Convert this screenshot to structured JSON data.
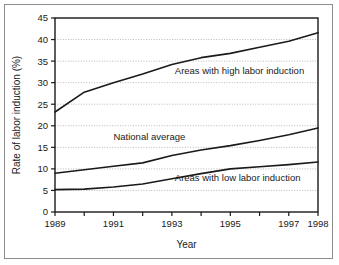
{
  "chart_data": {
    "type": "line",
    "title": "",
    "xlabel": "Year",
    "ylabel": "Rate of labor induction (%)",
    "xlim": [
      1989,
      1998
    ],
    "ylim": [
      0,
      45
    ],
    "ytick_step": 5,
    "grid": "horizontal-dotted",
    "legend_position": "inline-annotations",
    "x": [
      1989,
      1990,
      1991,
      1992,
      1993,
      1994,
      1995,
      1996,
      1997,
      1998
    ],
    "xticks": [
      1989,
      1990,
      1991,
      1992,
      1993,
      1994,
      1995,
      1996,
      1997,
      1998
    ],
    "xtick_labels": [
      "1989",
      "1991",
      "1993",
      "1995",
      "1997",
      "1998"
    ],
    "xtick_labels_values": [
      1989,
      1991,
      1993,
      1995,
      1997,
      1998
    ],
    "ytick_labels": [
      "0",
      "5",
      "10",
      "15",
      "20",
      "25",
      "30",
      "35",
      "40",
      "45"
    ],
    "ytick_values": [
      0,
      5,
      10,
      15,
      20,
      25,
      30,
      35,
      40,
      45
    ],
    "series": [
      {
        "name": "Areas with high labor induction",
        "values": [
          23.2,
          27.8,
          30.0,
          32.0,
          34.2,
          35.8,
          36.8,
          38.2,
          39.6,
          41.6
        ]
      },
      {
        "name": "National average",
        "values": [
          9.0,
          9.8,
          10.6,
          11.4,
          13.1,
          14.4,
          15.4,
          16.6,
          17.9,
          19.5
        ]
      },
      {
        "name": "Areas with low labor induction",
        "values": [
          5.2,
          5.3,
          5.8,
          6.5,
          7.7,
          8.9,
          10.0,
          10.5,
          11.0,
          11.6
        ]
      }
    ],
    "annotations": [
      {
        "text": "Areas with high labor induction",
        "x": 1993.1,
        "y": 32.1
      },
      {
        "text": "National average",
        "x": 1991.0,
        "y": 16.8
      },
      {
        "text": "Areas with low labor induction",
        "x": 1993.1,
        "y": 7.2
      }
    ],
    "colors": {
      "line": "#1a1a1a",
      "grid": "#b9b9b9",
      "axis": "#1a1a1a",
      "frame": "#8d8d8d",
      "background": "#ffffff"
    }
  }
}
